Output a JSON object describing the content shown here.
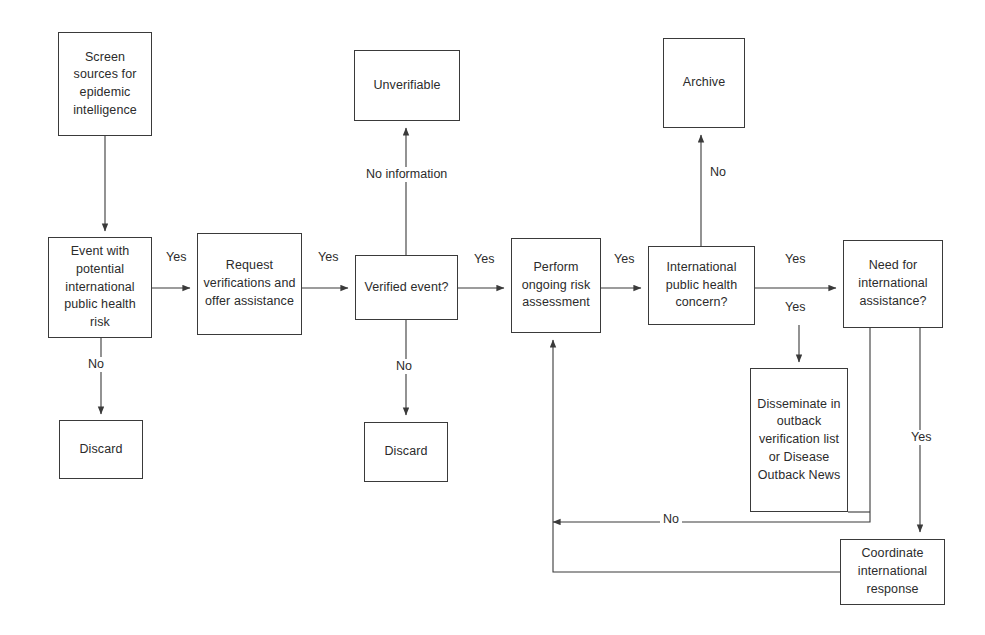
{
  "diagram": {
    "colors": {
      "stroke": "#3a3a3a",
      "text": "#2b2b2b",
      "background": "#ffffff"
    },
    "nodes": [
      {
        "id": "screen_sources",
        "label": "Screen sources for epidemic intelligence",
        "shape": "rect",
        "x": 58,
        "y": 32,
        "w": 94,
        "h": 104
      },
      {
        "id": "unverifiable",
        "label": "Unverifiable",
        "shape": "rect",
        "x": 354,
        "y": 50,
        "w": 106,
        "h": 71
      },
      {
        "id": "archive",
        "label": "Archive",
        "shape": "rect",
        "x": 663,
        "y": 38,
        "w": 82,
        "h": 90
      },
      {
        "id": "event_potential",
        "label": "Event with potential international public health risk",
        "shape": "rect",
        "x": 48,
        "y": 237,
        "w": 104,
        "h": 101
      },
      {
        "id": "request_verifications",
        "label": "Request verifications and offer assistance",
        "shape": "rect",
        "x": 197,
        "y": 233,
        "w": 105,
        "h": 102
      },
      {
        "id": "verified_event",
        "label": "Verified event?",
        "shape": "rect",
        "x": 355,
        "y": 255,
        "w": 103,
        "h": 65
      },
      {
        "id": "perform_risk",
        "label": "Perform ongoing risk assessment",
        "shape": "rect",
        "x": 511,
        "y": 238,
        "w": 90,
        "h": 95
      },
      {
        "id": "intl_concern",
        "label": "International public health concern?",
        "shape": "rect",
        "x": 648,
        "y": 246,
        "w": 107,
        "h": 79
      },
      {
        "id": "need_assistance",
        "label": "Need for international assistance?",
        "shape": "rect",
        "x": 843,
        "y": 240,
        "w": 100,
        "h": 88
      },
      {
        "id": "discard_1",
        "label": "Discard",
        "shape": "rect",
        "x": 59,
        "y": 420,
        "w": 84,
        "h": 59
      },
      {
        "id": "discard_2",
        "label": "Discard",
        "shape": "rect",
        "x": 364,
        "y": 422,
        "w": 84,
        "h": 60
      },
      {
        "id": "disseminate",
        "label": "Disseminate in outback verification list or Disease Outback News",
        "shape": "rect",
        "x": 750,
        "y": 368,
        "w": 98,
        "h": 144
      },
      {
        "id": "coordinate",
        "label": "Coordinate international response",
        "shape": "rect",
        "x": 840,
        "y": 539,
        "w": 105,
        "h": 66
      }
    ],
    "edge_labels": [
      {
        "id": "lbl_yes_1",
        "text": "Yes",
        "x": 163,
        "y": 250
      },
      {
        "id": "lbl_no_1",
        "text": "No",
        "x": 85,
        "y": 357
      },
      {
        "id": "lbl_yes_2",
        "text": "Yes",
        "x": 315,
        "y": 250
      },
      {
        "id": "lbl_no_information",
        "text": "No information",
        "x": 363,
        "y": 167
      },
      {
        "id": "lbl_yes_3",
        "text": "Yes",
        "x": 471,
        "y": 252
      },
      {
        "id": "lbl_no_2",
        "text": "No",
        "x": 393,
        "y": 359
      },
      {
        "id": "lbl_yes_4",
        "text": "Yes",
        "x": 611,
        "y": 252
      },
      {
        "id": "lbl_no_3",
        "text": "No",
        "x": 707,
        "y": 165
      },
      {
        "id": "lbl_yes_5",
        "text": "Yes",
        "x": 782,
        "y": 252
      },
      {
        "id": "lbl_yes_6",
        "text": "Yes",
        "x": 782,
        "y": 300
      },
      {
        "id": "lbl_yes_7",
        "text": "Yes",
        "x": 908,
        "y": 430
      },
      {
        "id": "lbl_no_4",
        "text": "No",
        "x": 660,
        "y": 512
      }
    ],
    "edges": [
      {
        "id": "e_screen_to_event",
        "from": "screen_sources",
        "to": "event_potential",
        "label": ""
      },
      {
        "id": "e_event_to_request",
        "from": "event_potential",
        "to": "request_verifications",
        "label": "Yes"
      },
      {
        "id": "e_event_to_discard",
        "from": "event_potential",
        "to": "discard_1",
        "label": "No"
      },
      {
        "id": "e_request_to_verified",
        "from": "request_verifications",
        "to": "verified_event",
        "label": "Yes"
      },
      {
        "id": "e_verified_to_unverifiable",
        "from": "verified_event",
        "to": "unverifiable",
        "label": "No information"
      },
      {
        "id": "e_verified_to_perform",
        "from": "verified_event",
        "to": "perform_risk",
        "label": "Yes"
      },
      {
        "id": "e_verified_to_discard2",
        "from": "verified_event",
        "to": "discard_2",
        "label": "No"
      },
      {
        "id": "e_perform_to_concern",
        "from": "perform_risk",
        "to": "intl_concern",
        "label": "Yes"
      },
      {
        "id": "e_concern_to_archive",
        "from": "intl_concern",
        "to": "archive",
        "label": "No"
      },
      {
        "id": "e_concern_to_need",
        "from": "intl_concern",
        "to": "need_assistance",
        "label": "Yes"
      },
      {
        "id": "e_concern_to_disseminate",
        "from": "intl_concern",
        "to": "disseminate",
        "label": "Yes"
      },
      {
        "id": "e_need_to_coordinate",
        "from": "need_assistance",
        "to": "coordinate",
        "label": "Yes"
      },
      {
        "id": "e_disseminate_to_perform",
        "from": "disseminate",
        "to": "perform_risk",
        "label": "No"
      },
      {
        "id": "e_coordinate_to_perform",
        "from": "coordinate",
        "to": "perform_risk",
        "label": ""
      }
    ]
  }
}
